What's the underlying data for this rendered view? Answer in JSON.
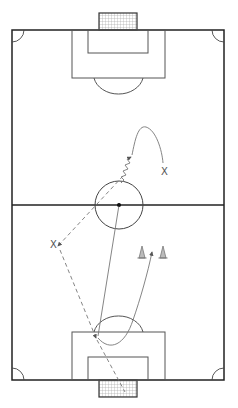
{
  "diagram": {
    "type": "soccer-drill",
    "colors": {
      "background": "#ffffff",
      "field_lines": "#222222",
      "inner_lines": "#555555",
      "movement_lines": "#777777",
      "net": "#888888",
      "cone": "#999999"
    },
    "players": [
      {
        "id": "player-top-right",
        "label": "X",
        "x": 165,
        "y": 171
      },
      {
        "id": "player-left",
        "label": "X",
        "x": 56,
        "y": 244
      }
    ],
    "cones": [
      {
        "id": "cone-left",
        "x": 142,
        "y": 253
      },
      {
        "id": "cone-right",
        "x": 163,
        "y": 253
      }
    ],
    "ball_positions": [
      {
        "id": "ball-center",
        "x": 119,
        "y": 205
      }
    ],
    "movements": [
      {
        "id": "dribble-zigzag",
        "style": "zigzag",
        "from": "center-circle",
        "to": "top-curve"
      },
      {
        "id": "run-curve-top",
        "style": "solid-curve",
        "to": "player-top-right"
      },
      {
        "id": "pass-dashed-to-left",
        "style": "dashed",
        "from": "center",
        "to": "player-left"
      },
      {
        "id": "pass-dashed-to-box",
        "style": "dashed",
        "from": "player-left",
        "to": "penalty-arc"
      },
      {
        "id": "shot-dashed-to-goal",
        "style": "dashed",
        "from": "penalty-arc",
        "to": "bottom-goal"
      },
      {
        "id": "pass-solid-long",
        "style": "solid",
        "from": "center",
        "to": "penalty-arc"
      },
      {
        "id": "run-curve-cones",
        "style": "solid-curve",
        "from": "penalty-arc",
        "to": "between-cones"
      }
    ]
  }
}
